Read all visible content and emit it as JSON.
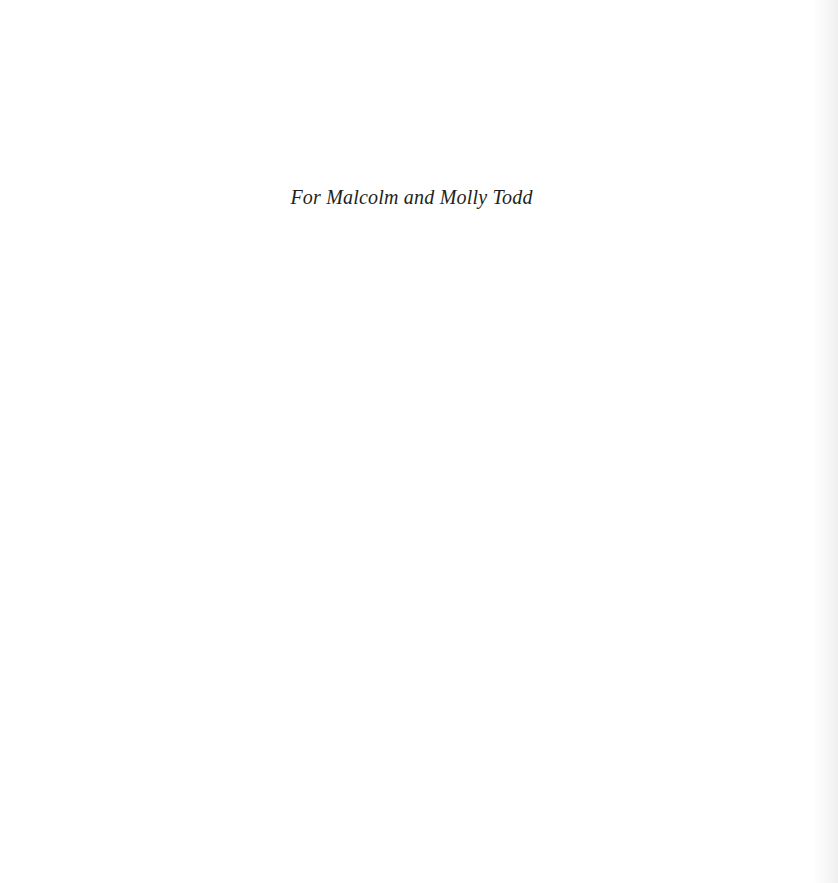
{
  "page": {
    "dedication": "For Malcolm and Molly Todd"
  }
}
